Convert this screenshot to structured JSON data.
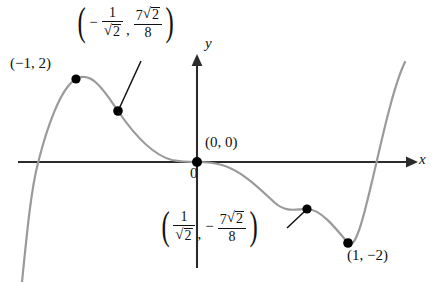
{
  "figure": {
    "axes": {
      "x_axis_label": "x",
      "y_axis_label": "y",
      "origin_label": "0"
    },
    "curve": {
      "color": "#9a9a9a",
      "axis_color": "#2b2b2b",
      "point_color": "#000000"
    },
    "annotations": {
      "local_max": {
        "name": "local-maximum",
        "text": "(−1, 2)",
        "point": {
          "x": -1,
          "y": 2
        }
      },
      "origin": {
        "name": "origin-point",
        "text": "(0, 0)",
        "point": {
          "x": 0,
          "y": 0
        }
      },
      "local_min": {
        "name": "local-minimum",
        "text": "(1, −2)",
        "point": {
          "x": 1,
          "y": -2
        }
      },
      "inflection_left": {
        "name": "inflection-point-left",
        "x_num": "1",
        "x_den_radicand": "2",
        "x_sign": "−",
        "y_num_coef": "7",
        "y_num_radicand": "2",
        "y_den": "8",
        "point": {
          "x": -0.7071,
          "y": 1.2374
        }
      },
      "inflection_right": {
        "name": "inflection-point-right",
        "x_num": "1",
        "x_den_radicand": "2",
        "y_sign": "−",
        "y_num_coef": "7",
        "y_num_radicand": "2",
        "y_den": "8",
        "point": {
          "x": 0.7071,
          "y": -1.2374
        }
      }
    }
  }
}
